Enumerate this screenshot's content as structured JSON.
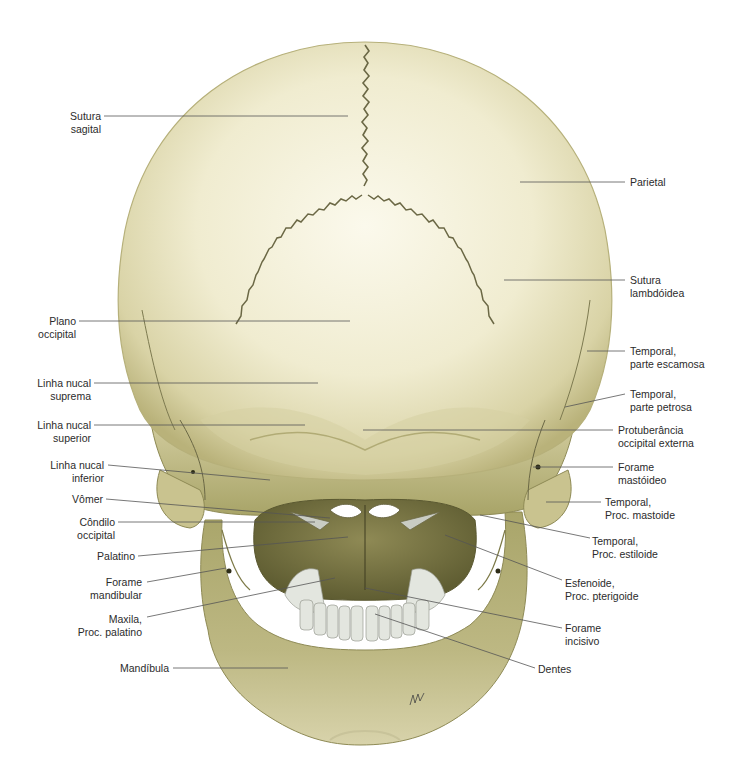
{
  "figure": {
    "view": "Crânio, vista posterior",
    "colors": {
      "bone_light": "#f4f1de",
      "bone_mid": "#dcd6ae",
      "bone_dark": "#a9a46b",
      "bone_shadow": "#6f6d3c",
      "suture": "#6b6845",
      "leader_line": "#555555",
      "text": "#2b2b2b",
      "teeth": "#e6e8e2"
    },
    "labels_left": [
      {
        "id": "sutura-sagital",
        "lines": [
          "Sutura",
          "sagital"
        ]
      },
      {
        "id": "plano-occipital",
        "lines": [
          "Plano",
          "occipital"
        ]
      },
      {
        "id": "linha-nucal-suprema",
        "lines": [
          "Linha nucal",
          "suprema"
        ]
      },
      {
        "id": "linha-nucal-superior",
        "lines": [
          "Linha nucal",
          "superior"
        ]
      },
      {
        "id": "linha-nucal-inferior",
        "lines": [
          "Linha nucal",
          "inferior"
        ]
      },
      {
        "id": "vomer",
        "lines": [
          "Vômer"
        ]
      },
      {
        "id": "condilo-occipital",
        "lines": [
          "Côndilo",
          "occipital"
        ]
      },
      {
        "id": "palatino",
        "lines": [
          "Palatino"
        ]
      },
      {
        "id": "forame-mandibular",
        "lines": [
          "Forame",
          "mandibular"
        ]
      },
      {
        "id": "maxila-proc-palatino",
        "lines": [
          "Maxila,",
          "Proc. palatino"
        ]
      },
      {
        "id": "mandibula",
        "lines": [
          "Mandíbula"
        ]
      }
    ],
    "labels_right": [
      {
        "id": "parietal",
        "lines": [
          "Parietal"
        ]
      },
      {
        "id": "sutura-lambdoidea",
        "lines": [
          "Sutura",
          "lambdóidea"
        ]
      },
      {
        "id": "temporal-parte-escamosa",
        "lines": [
          "Temporal,",
          "parte escamosa"
        ]
      },
      {
        "id": "temporal-parte-petrosa",
        "lines": [
          "Temporal,",
          "parte petrosa"
        ]
      },
      {
        "id": "protuberancia-occipital-externa",
        "lines": [
          "Protuberância",
          "occipital externa"
        ]
      },
      {
        "id": "forame-mastoideo",
        "lines": [
          "Forame",
          "mastóideo"
        ]
      },
      {
        "id": "temporal-proc-mastoide",
        "lines": [
          "Temporal,",
          "Proc. mastoide"
        ]
      },
      {
        "id": "temporal-proc-estiloide",
        "lines": [
          "Temporal,",
          "Proc. estiloide"
        ]
      },
      {
        "id": "esfenoide-proc-pterigoide",
        "lines": [
          "Esfenoide,",
          "Proc. pterigoide"
        ]
      },
      {
        "id": "forame-incisivo",
        "lines": [
          "Forame",
          "incisivo"
        ]
      },
      {
        "id": "dentes",
        "lines": [
          "Dentes"
        ]
      }
    ]
  }
}
